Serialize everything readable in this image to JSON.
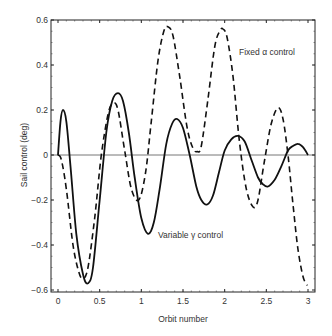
{
  "chart_data": {
    "type": "line",
    "title": "",
    "xlabel": "Orbit number",
    "ylabel": "Sail control (deg)",
    "xlim": [
      0,
      3
    ],
    "ylim": [
      -0.6,
      0.6
    ],
    "xticks": [
      0,
      0.5,
      1,
      1.5,
      2,
      2.5,
      3
    ],
    "xtick_labels": [
      "0",
      "0.5",
      "1",
      "1.5",
      "2",
      "2.5",
      "3"
    ],
    "yticks": [
      0.6,
      0.4,
      0.2,
      0,
      -0.2,
      -0.4,
      -0.6
    ],
    "ytick_labels": [
      "0.6",
      "0.4",
      "0.2",
      "0",
      "−0.2",
      "−0.4",
      "−0.6"
    ],
    "grid": false,
    "legend": "none (inline annotations)",
    "annotations": [
      {
        "text": "Fixed α control",
        "x": 2.2,
        "y": 0.46
      },
      {
        "text": "Variable γ control",
        "x": 1.2,
        "y": -0.36
      }
    ],
    "series": [
      {
        "name": "Variable γ control",
        "style": "solid",
        "x": [
          0,
          0.03,
          0.06,
          0.1,
          0.15,
          0.22,
          0.3,
          0.36,
          0.42,
          0.5,
          0.58,
          0.65,
          0.72,
          0.78,
          0.85,
          0.92,
          1.0,
          1.08,
          1.15,
          1.22,
          1.3,
          1.37,
          1.43,
          1.5,
          1.58,
          1.66,
          1.72,
          1.79,
          1.86,
          1.93,
          2.0,
          2.08,
          2.16,
          2.24,
          2.32,
          2.4,
          2.46,
          2.52,
          2.6,
          2.68,
          2.76,
          2.82,
          2.88,
          2.94,
          3.0
        ],
        "y": [
          0,
          0.15,
          0.2,
          0.15,
          -0.05,
          -0.35,
          -0.53,
          -0.57,
          -0.5,
          -0.2,
          0.1,
          0.24,
          0.275,
          0.24,
          0.1,
          -0.1,
          -0.28,
          -0.35,
          -0.3,
          -0.15,
          0.05,
          0.14,
          0.16,
          0.12,
          0.0,
          -0.14,
          -0.2,
          -0.22,
          -0.18,
          -0.08,
          0.02,
          0.07,
          0.085,
          0.06,
          -0.02,
          -0.1,
          -0.13,
          -0.14,
          -0.11,
          -0.05,
          0.02,
          0.04,
          0.05,
          0.035,
          0.0
        ]
      },
      {
        "name": "Fixed α control",
        "style": "dashed",
        "x": [
          0,
          0.04,
          0.1,
          0.18,
          0.25,
          0.3,
          0.36,
          0.44,
          0.52,
          0.6,
          0.66,
          0.72,
          0.8,
          0.88,
          0.97,
          1.05,
          1.12,
          1.2,
          1.27,
          1.32,
          1.38,
          1.46,
          1.55,
          1.62,
          1.67,
          1.72,
          1.8,
          1.88,
          1.94,
          1.98,
          2.03,
          2.1,
          2.18,
          2.26,
          2.34,
          2.4,
          2.48,
          2.56,
          2.64,
          2.7,
          2.76,
          2.82,
          2.88,
          2.94,
          2.99
        ],
        "y": [
          0,
          -0.02,
          -0.15,
          -0.4,
          -0.52,
          -0.55,
          -0.5,
          -0.28,
          0.0,
          0.18,
          0.23,
          0.2,
          0.02,
          -0.15,
          -0.2,
          -0.08,
          0.15,
          0.42,
          0.55,
          0.57,
          0.53,
          0.35,
          0.12,
          0.03,
          0.015,
          0.04,
          0.25,
          0.48,
          0.55,
          0.56,
          0.52,
          0.35,
          0.05,
          -0.15,
          -0.23,
          -0.2,
          -0.02,
          0.14,
          0.21,
          0.16,
          0.0,
          -0.22,
          -0.42,
          -0.54,
          -0.58
        ]
      }
    ]
  }
}
